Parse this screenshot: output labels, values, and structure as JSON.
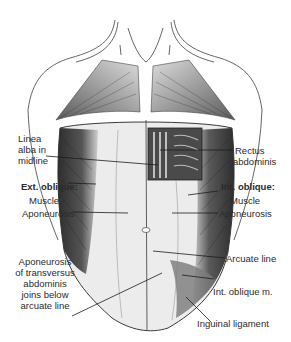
{
  "figure": {
    "colors": {
      "background": "#ffffff",
      "outline": "#3a3a3a",
      "muscle_dark": "#3d3d3d",
      "muscle_mid": "#8a8a8a",
      "aponeurosis_light": "#e8e8e8",
      "label_text": "#2b2b2b"
    }
  },
  "labels": {
    "linea_alba": {
      "lines": [
        "Linea",
        "alba in",
        "midline"
      ]
    },
    "rectus": {
      "lines": [
        "Rectus",
        "abdominis"
      ]
    },
    "ext_oblique": {
      "title": "Ext. oblique:",
      "muscle": "Muscle",
      "aponeurosis": "Aponeurosis"
    },
    "int_oblique": {
      "title": "Int. oblique:",
      "muscle": "Muscle",
      "aponeurosis": "Aponeurosis"
    },
    "transversus": {
      "lines": [
        "Aponeurosis",
        "of transversus",
        "abdominis",
        "joins below",
        "arcuate line"
      ]
    },
    "arcuate_line": "Arcuate line",
    "int_oblique_m": "Int. oblique m.",
    "inguinal_ligament": "Inguinal ligament"
  }
}
